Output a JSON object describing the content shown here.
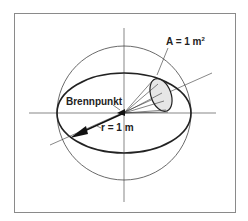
{
  "diagram": {
    "title": "",
    "labels": {
      "area": "A = 1 m",
      "area_exponent": "2",
      "focus": "Brennpunkt",
      "radius": "r = 1 m"
    },
    "elements": [
      "bounding-frame",
      "sphere-outline",
      "equator-ellipse",
      "horizontal-axis",
      "vertical-axis",
      "diagonal-axis",
      "cone-to-area",
      "area-patch",
      "radius-arrow",
      "focus-point"
    ],
    "colors": {
      "line": "#222222",
      "thin_line": "#555555",
      "patch_fill": "#e6e6e6",
      "frame": "#8a8a8a"
    }
  }
}
